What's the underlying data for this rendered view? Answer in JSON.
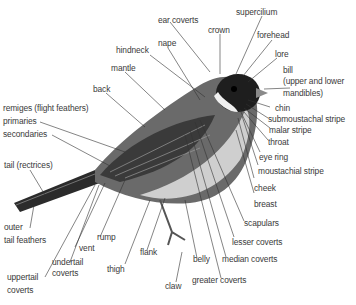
{
  "labels": {
    "ear_coverts": "ear coverts",
    "supercilium": "supercilium",
    "crown": "crown",
    "forehead": "forehead",
    "hindneck": "hindneck",
    "nape": "nape",
    "lore": "lore",
    "mantle": "mantle",
    "bill": "bill",
    "bill_2": "(upper and lower",
    "bill_3": "mandibles)",
    "back": "back",
    "remiges": "remiges (flight feathers)",
    "primaries": "primaries",
    "secondaries": "secondaries",
    "chin": "chin",
    "submoustachal_stripe": "submoustachal stripe",
    "malar_stripe": "malar stripe",
    "throat": "throat",
    "eye_ring": "eye ring",
    "moustachial_stripe": "moustachial stripe",
    "tail": "tail (rectrices)",
    "cheek": "cheek",
    "breast": "breast",
    "scapulars": "scapulars",
    "outer": "outer",
    "tail_feathers": "tail feathers",
    "rump": "rump",
    "vent": "vent",
    "lesser_coverts": "lesser coverts",
    "undertail": "undertail",
    "undertail_2": "coverts",
    "flank": "flank",
    "belly": "belly",
    "median_coverts": "median coverts",
    "thigh": "thigh",
    "uppertail": "uppertail",
    "uppertail_2": "coverts",
    "claw": "claw",
    "greater_coverts": "greater coverts"
  }
}
